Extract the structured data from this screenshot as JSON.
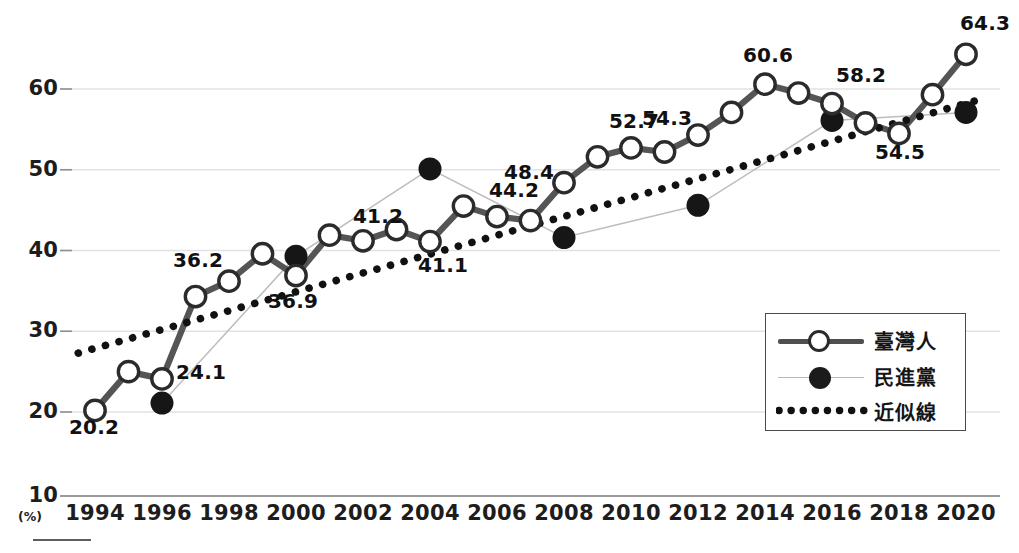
{
  "chart_data": {
    "type": "line",
    "title": "",
    "subtitle": "",
    "xlabel": "",
    "ylabel": "",
    "y_unit": "(%)",
    "ylim": [
      10,
      66
    ],
    "xlim": [
      1993.4,
      2020.9
    ],
    "grid": true,
    "gridlines": [
      20,
      30,
      40,
      50,
      60
    ],
    "yticks": [
      10,
      20,
      30,
      40,
      50,
      60
    ],
    "ytick_labels": [
      "10",
      "20",
      "30",
      "40",
      "50",
      "60"
    ],
    "xticks": [
      1994,
      1996,
      1998,
      2000,
      2002,
      2004,
      2006,
      2008,
      2010,
      2012,
      2014,
      2016,
      2018,
      2020
    ],
    "xtick_labels": [
      "1994",
      "1996",
      "1998",
      "2000",
      "2002",
      "2004",
      "2006",
      "2008",
      "2010",
      "2012",
      "2014",
      "2016",
      "2018",
      "2020"
    ],
    "legend_position": "lower-right",
    "series": [
      {
        "name": "臺灣人",
        "style": "line-marker-open-circle",
        "color": "#4f4f4f",
        "x": [
          1994,
          1995,
          1996,
          1997,
          1998,
          1999,
          2000,
          2001,
          2002,
          2003,
          2004,
          2005,
          2006,
          2007,
          2008,
          2009,
          2010,
          2011,
          2012,
          2013,
          2014,
          2015,
          2016,
          2017,
          2018,
          2019,
          2020
        ],
        "values": [
          20.2,
          25.0,
          24.1,
          34.3,
          36.2,
          39.6,
          36.9,
          41.9,
          41.2,
          42.6,
          41.1,
          45.5,
          44.2,
          43.7,
          48.4,
          51.6,
          52.7,
          52.2,
          54.3,
          57.1,
          60.6,
          59.5,
          58.2,
          55.8,
          54.5,
          59.3,
          64.3
        ]
      },
      {
        "name": "民進黨",
        "style": "thin-line-marker-filled-circle",
        "color": "#1b1b1b",
        "x": [
          1996,
          2000,
          2004,
          2008,
          2012,
          2016,
          2020
        ],
        "values": [
          21.1,
          39.3,
          50.1,
          41.6,
          45.6,
          56.1,
          57.1
        ]
      },
      {
        "name": "近似線",
        "style": "dotted-trendline",
        "color": "#111111",
        "x": [
          1993.5,
          2020.5
        ],
        "values": [
          27.3,
          58.8
        ]
      }
    ],
    "value_labels": [
      {
        "text": "20.2",
        "x": 1994,
        "value": 20.2
      },
      {
        "text": "24.1",
        "x": 1996,
        "value": 24.1
      },
      {
        "text": "36.2",
        "x": 1998,
        "value": 36.2
      },
      {
        "text": "36.9",
        "x": 2000,
        "value": 36.9
      },
      {
        "text": "41.2",
        "x": 2002,
        "value": 41.2
      },
      {
        "text": "41.1",
        "x": 2004,
        "value": 41.1
      },
      {
        "text": "44.2",
        "x": 2006,
        "value": 44.2
      },
      {
        "text": "48.4",
        "x": 2008,
        "value": 48.4
      },
      {
        "text": "52.7",
        "x": 2010,
        "value": 52.7
      },
      {
        "text": "54.3",
        "x": 2012,
        "value": 54.3
      },
      {
        "text": "60.6",
        "x": 2014,
        "value": 60.6
      },
      {
        "text": "58.2",
        "x": 2016,
        "value": 58.2
      },
      {
        "text": "54.5",
        "x": 2018,
        "value": 54.5
      },
      {
        "text": "64.3",
        "x": 2020,
        "value": 64.3
      }
    ]
  },
  "legend": {
    "items": [
      {
        "label": "臺灣人",
        "symbol": "line-open-circle"
      },
      {
        "label": "民進黨",
        "symbol": "filled-circle"
      },
      {
        "label": "近似線",
        "symbol": "dotted-line"
      }
    ]
  },
  "axis": {
    "y_unit_label": "(%)"
  }
}
